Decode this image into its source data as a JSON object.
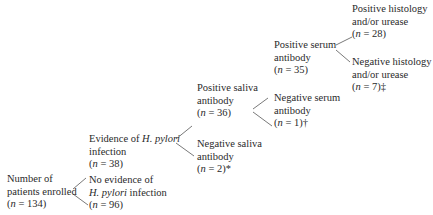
{
  "diagram": {
    "type": "flowchart-tree",
    "nodes": [
      {
        "id": "enrolled",
        "lines": [
          "Number of",
          "patients enrolled",
          "(n = 134)"
        ],
        "n": 134
      },
      {
        "id": "evidence",
        "lines": [
          "Evidence of H. pylori",
          "infection",
          "(n = 38)"
        ],
        "n": 38
      },
      {
        "id": "no_evidence",
        "lines": [
          "No evidence of",
          "H. pylori infection",
          "(n = 96)"
        ],
        "n": 96
      },
      {
        "id": "pos_saliva",
        "lines": [
          "Positive saliva",
          "antibody",
          "(n = 36)"
        ],
        "n": 36
      },
      {
        "id": "neg_saliva",
        "lines": [
          "Negative saliva",
          "antibody",
          "(n = 2)*"
        ],
        "n": 2,
        "footnote": "*"
      },
      {
        "id": "pos_serum",
        "lines": [
          "Positive serum",
          "antibody",
          "(n = 35)"
        ],
        "n": 35
      },
      {
        "id": "neg_serum",
        "lines": [
          "Negative serum",
          "antibody",
          "(n = 1)†"
        ],
        "n": 1,
        "footnote": "†"
      },
      {
        "id": "pos_hist",
        "lines": [
          "Positive histology",
          "and/or urease",
          "(n = 28)"
        ],
        "n": 28
      },
      {
        "id": "neg_hist",
        "lines": [
          "Negative histology",
          "and/or urease",
          "(n = 7)‡"
        ],
        "n": 7,
        "footnote": "‡"
      }
    ],
    "edges": [
      [
        "enrolled",
        "evidence"
      ],
      [
        "enrolled",
        "no_evidence"
      ],
      [
        "evidence",
        "pos_saliva"
      ],
      [
        "evidence",
        "neg_saliva"
      ],
      [
        "pos_saliva",
        "pos_serum"
      ],
      [
        "pos_saliva",
        "neg_serum"
      ],
      [
        "pos_serum",
        "pos_hist"
      ],
      [
        "pos_serum",
        "neg_hist"
      ]
    ]
  },
  "text": {
    "enrolled_1": "Number of",
    "enrolled_2": "patients enrolled",
    "enrolled_n": "134",
    "evidence_1a": "Evidence of ",
    "evidence_1b": "H. pylori",
    "evidence_2": "infection",
    "evidence_n": "38",
    "noevid_1": "No evidence of",
    "noevid_2a": "H. pylori",
    "noevid_2b": " infection",
    "noevid_n": "96",
    "possal_1": "Positive saliva",
    "possal_2": "antibody",
    "possal_n": "36",
    "negsal_1": "Negative saliva",
    "negsal_2": "antibody",
    "negsal_n": "2",
    "negsal_fn": "*",
    "posser_1": "Positive serum",
    "posser_2": "antibody",
    "posser_n": "35",
    "negser_1": "Negative serum",
    "negser_2": "antibody",
    "negser_n": "1",
    "negser_fn": "†",
    "poshist_1": "Positive histology",
    "poshist_2": "and/or urease",
    "poshist_n": "28",
    "neghist_1": "Negative histology",
    "neghist_2": "and/or urease",
    "neghist_n": "7",
    "neghist_fn": "‡",
    "n_prefix": "(",
    "n_var": "n",
    "n_eq": " = ",
    "n_suffix": ")"
  }
}
